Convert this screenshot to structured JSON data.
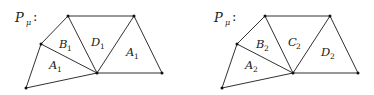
{
  "diagrams": [
    {
      "title": "P",
      "title_sub": "μ",
      "title_colon": ":",
      "offset_x": 0,
      "regions": [
        {
          "letter": "B",
          "sub": "1"
        },
        {
          "letter": "D",
          "sub": "1"
        },
        {
          "letter": "A",
          "sub": "1"
        },
        {
          "letter": "A",
          "sub": "1"
        }
      ]
    },
    {
      "title": "P",
      "title_sub": "μ",
      "title_colon": ":",
      "offset_x": 196,
      "regions": [
        {
          "letter": "B",
          "sub": "2"
        },
        {
          "letter": "C",
          "sub": "2"
        },
        {
          "letter": "A",
          "sub": "2"
        },
        {
          "letter": "D",
          "sub": "2"
        }
      ]
    }
  ]
}
